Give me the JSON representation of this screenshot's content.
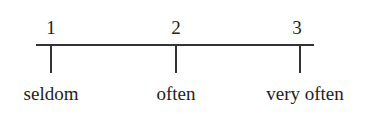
{
  "scale": {
    "points": [
      {
        "number": "1",
        "label": "seldom"
      },
      {
        "number": "2",
        "label": "often"
      },
      {
        "number": "3",
        "label": "very often"
      }
    ]
  }
}
